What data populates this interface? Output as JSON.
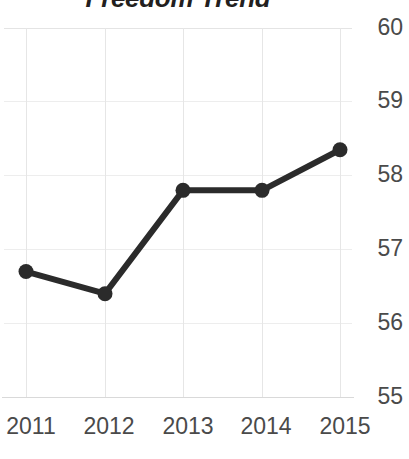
{
  "chart_data": {
    "type": "line",
    "title": "Freedom Trend",
    "xlabel": "",
    "ylabel": "",
    "categories": [
      "2011",
      "2012",
      "2013",
      "2014",
      "2015"
    ],
    "values": [
      56.7,
      56.4,
      57.8,
      57.8,
      58.35
    ],
    "series": [
      {
        "name": "Freedom Score",
        "values": [
          56.7,
          56.4,
          57.8,
          57.8,
          58.35
        ]
      }
    ],
    "ylim": [
      55,
      60
    ],
    "yticks": [
      60,
      59,
      58,
      57,
      56,
      55
    ],
    "ytick_labels": [
      "60",
      "59",
      "58",
      "57",
      "56",
      "55"
    ],
    "xtick_labels": [
      "2011",
      "2012",
      "2013",
      "2014",
      "2015"
    ],
    "grid": true,
    "y_axis_position": "right",
    "legend": false,
    "legend_position": "none",
    "marker": "circle",
    "annotations": []
  },
  "style": {
    "line_color": "#2b2b2b",
    "marker_color": "#2b2b2b",
    "grid_color": "#ededed",
    "axis_color": "#d9d9d9",
    "label_color": "#4a4a4a",
    "title_color": "#231f20",
    "background": "#ffffff"
  }
}
